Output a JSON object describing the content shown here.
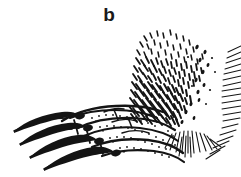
{
  "figure": {
    "panel_label": "b",
    "style": "black ink line drawing on white background",
    "background_color": "#ffffff",
    "ink_color": "#141414",
    "width_px": 241,
    "height_px": 177
  },
  "parts": [
    {
      "name": "claw-1-uppermost",
      "description": "long curved pointed claw, upper row"
    },
    {
      "name": "claw-2",
      "description": "long curved pointed claw, second row"
    },
    {
      "name": "claw-3",
      "description": "long curved pointed claw, third row"
    },
    {
      "name": "claw-4-lowermost",
      "description": "long curved pointed claw, lowest row"
    },
    {
      "name": "toe-segments",
      "description": "outlined digit segments with stippled shading"
    },
    {
      "name": "fur-mass",
      "description": "dense diagonal dash hatching over tarsus"
    },
    {
      "name": "fringe-right",
      "description": "row of fine parallel hairs along right margin"
    },
    {
      "name": "fringe-heel",
      "description": "radiating hairs below heel"
    }
  ]
}
